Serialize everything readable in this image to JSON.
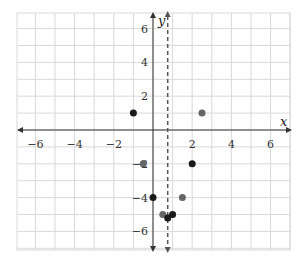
{
  "chart_data": {
    "type": "scatter",
    "title": "",
    "xlabel": "x",
    "ylabel": "y",
    "xlim": [
      -7,
      7
    ],
    "ylim": [
      -7,
      7
    ],
    "grid": true,
    "x_ticks": [
      -6,
      -4,
      -2,
      2,
      4,
      6
    ],
    "y_ticks": [
      6,
      4,
      2,
      -2,
      -4,
      -6
    ],
    "dashed_vertical_line": {
      "x": 0.75
    },
    "points": [
      {
        "x": -1,
        "y": 1,
        "color": "#1a1a1a"
      },
      {
        "x": 2.5,
        "y": 1,
        "color": "#666666"
      },
      {
        "x": -0.5,
        "y": -2,
        "color": "#666666"
      },
      {
        "x": 2,
        "y": -2,
        "color": "#1a1a1a"
      },
      {
        "x": 0,
        "y": -4,
        "color": "#1a1a1a"
      },
      {
        "x": 1.5,
        "y": -4,
        "color": "#666666"
      },
      {
        "x": 0.5,
        "y": -5,
        "color": "#666666"
      },
      {
        "x": 0.75,
        "y": -5.2,
        "color": "#1a1a1a"
      },
      {
        "x": 1,
        "y": -5,
        "color": "#1a1a1a"
      }
    ]
  },
  "colors": {
    "grid": "#d9d9d9",
    "axis": "#333333",
    "dashed": "#555555"
  }
}
